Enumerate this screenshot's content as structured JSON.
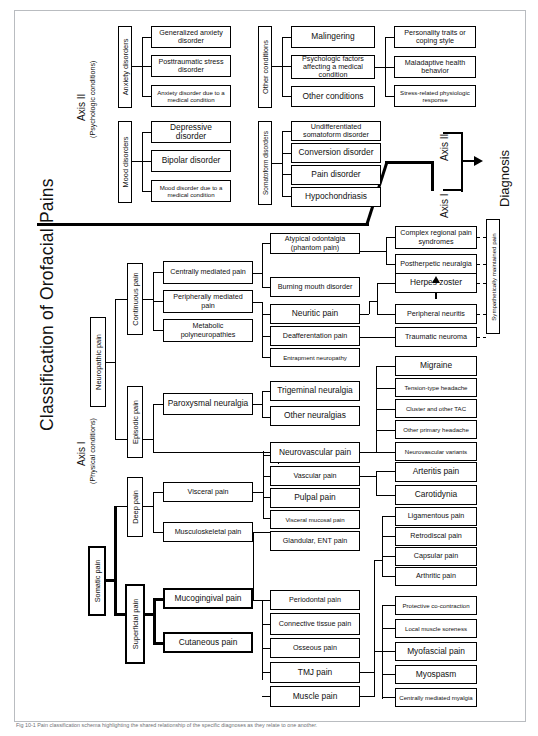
{
  "figure": {
    "title": "Classification of Orofacial Pains",
    "caption": "Fig 10-1  Pain classification schema highlighting the shared relationship of the specific diagnoses as they relate to one another."
  },
  "axis2": {
    "label": "Axis II",
    "sublabel": "(Psychologic conditions)",
    "groups": [
      {
        "name": "Anxiety disorders",
        "items": [
          "Generalized anxiety disorder",
          "Posttraumatic stress disorder",
          "Anxiety disorder due to a medical condition"
        ]
      },
      {
        "name": "Mood disorders",
        "items": [
          "Depressive disorder",
          "Bipolar disorder",
          "Mood disorder due to a medical condition"
        ]
      },
      {
        "name": "Other conditions",
        "items": [
          "Malingering",
          "Psychologic factors affecting a medical condition",
          "Other conditions"
        ],
        "subitems": [
          "Personality traits or coping style",
          "Maladaptive health behavior",
          "Stress-related physiologic response"
        ]
      },
      {
        "name": "Somatoform disorders",
        "items": [
          "Undifferentiated somatoform disorder",
          "Conversion disorder",
          "Pain disorder",
          "Hypochondriasis"
        ]
      }
    ]
  },
  "axis1": {
    "label": "Axis I",
    "sublabel": "(Physical conditions)",
    "neuropathic": {
      "name": "Neuropathic pain",
      "continuous": {
        "name": "Continuous pain",
        "items": [
          "Centrally mediated pain",
          "Peripherally mediated pain",
          "Metabolic polyneuropathies"
        ],
        "centrally_children": [
          "Atypical odontalgia (phantom pain)",
          "Burning mouth disorder"
        ],
        "peripherally_children": [
          "Neuritic pain",
          "Deafferentation pain",
          "Entrapment neuropathy"
        ],
        "neuritic_children": [
          "Herpes zoster",
          "Peripheral neuritis"
        ],
        "deafferentation_children": [
          "Traumatic neuroma"
        ]
      },
      "episodic": {
        "name": "Episodic pain",
        "items": [
          "Paroxysmal neuralgia",
          "Neurovascular pain"
        ],
        "paroxysmal_children": [
          "Trigeminal neuralgia",
          "Other neuralgias"
        ],
        "neurovascular_children": [
          "Migraine",
          "Tension-type headache",
          "Cluster and other TAC",
          "Other primary headache",
          "Neurovascular variants"
        ]
      }
    },
    "somatic": {
      "name": "Somatic pain",
      "deep": {
        "name": "Deep pain",
        "items": [
          "Visceral pain",
          "Musculoskeletal pain"
        ],
        "visceral_children": [
          "Vascular pain",
          "Pulpal pain",
          "Visceral mucosal pain",
          "Glandular, ENT pain"
        ],
        "vascular_children": [
          "Arteritis pain",
          "Carotidynia"
        ],
        "musculoskeletal_children": [
          "Periodontal pain",
          "Connective tissue pain",
          "Osseous pain",
          "TMJ pain",
          "Muscle pain"
        ],
        "tmj_children": [
          "Ligamentous pain",
          "Retrodiscal pain",
          "Capsular pain",
          "Arthritic pain"
        ],
        "muscle_children": [
          "Protective co-contraction",
          "Local muscle soreness",
          "Myofascial pain",
          "Myospasm",
          "Centrally mediated myalgia"
        ]
      },
      "superficial": {
        "name": "Superficial pain",
        "items": [
          "Mucogingival pain",
          "Cutaneous pain"
        ]
      }
    }
  },
  "sympathetic": {
    "label": "Sympathetically maintained pain",
    "items": [
      "Complex regional pain syndromes",
      "Postherpetic neuralgia"
    ]
  },
  "diagnosis": {
    "label": "Diagnosis",
    "axis1_label": "Axis I",
    "axis2_label": "Axis II"
  }
}
